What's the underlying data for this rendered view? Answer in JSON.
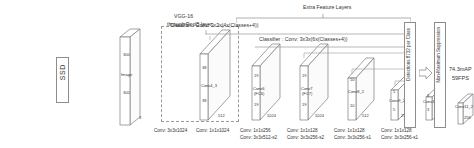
{
  "figure": {
    "extra_feature_layers_label": "Extra Feature Layers",
    "vgg_label_line1": "VGG-16",
    "vgg_label_line2": "through Pool5 layer",
    "ssd_label": "SSD",
    "input": {
      "h_label": "300",
      "name": "Image",
      "w_label": "300",
      "depth": "3"
    },
    "classifier_top": "Classifier : Conv: 3x3x(4x(Classes+4))",
    "classifier_second": "Classifier : Conv: 3x3x(6x(Classes+4))",
    "detections_label": "Detections:8732 per Class",
    "nms_label": "Non-Maximum Suppression",
    "result_line1": "74.3mAP",
    "result_line2": "59FPS"
  },
  "blocks": [
    {
      "id": "conv4_3",
      "name": "Conv4_3",
      "h": "38",
      "w": "38",
      "depth": "512",
      "conv_lines": []
    },
    {
      "id": "conv6",
      "name": "Conv6",
      "sub": "(FC6)",
      "h": "19",
      "w": "19",
      "depth": "1024",
      "conv_lines": [
        "Conv: 3x3x1024"
      ]
    },
    {
      "id": "conv7",
      "name": "Conv7",
      "sub": "(FC7)",
      "h": "19",
      "w": "19",
      "depth": "1024",
      "conv_lines": [
        "Conv: 1x1x1024"
      ]
    },
    {
      "id": "conv8_2",
      "name": "Conv8_2",
      "h": "10",
      "w": "10",
      "depth": "512",
      "conv_lines": [
        "Conv: 1x1x256",
        "Conv: 3x3x512-s2"
      ]
    },
    {
      "id": "conv9_2",
      "name": "Conv9_2",
      "h": "5",
      "w": "5",
      "depth": "256",
      "conv_lines": [
        "Conv: 1x1x128",
        "Conv: 3x3x256-s2"
      ]
    },
    {
      "id": "conv10_2",
      "name": "Conv10_2",
      "h": "3",
      "w": "3",
      "depth": "256",
      "conv_lines": [
        "Conv: 1x1x128",
        "Conv: 3x3x256-s1"
      ]
    },
    {
      "id": "conv11_2",
      "name": "Conv11_2",
      "h": "1",
      "w": "1",
      "depth": "256",
      "conv_lines": [
        "Conv: 1x1x128",
        "Conv: 3x3x256-s1"
      ]
    }
  ],
  "colors": {
    "stroke": "#8d8d8d",
    "dashed": "#9a9a9a",
    "text": "#333333",
    "background": "#ffffff"
  }
}
